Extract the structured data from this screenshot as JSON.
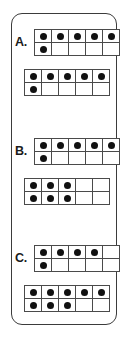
{
  "card": {
    "accent_color": "#3b3b3b",
    "dot_color": "#111111",
    "frame_line_color": "#4a4a4a",
    "background_color": "#ffffff"
  },
  "groups": [
    {
      "label": "A.",
      "frames": [
        {
          "name": "ten-frame-a-1",
          "top_row": [
            1,
            1,
            1,
            1,
            1
          ],
          "bottom_row": [
            1,
            0,
            0,
            0,
            0
          ],
          "count": 6
        },
        {
          "name": "ten-frame-a-2",
          "top_row": [
            1,
            1,
            1,
            1,
            1
          ],
          "bottom_row": [
            1,
            0,
            0,
            0,
            0
          ],
          "count": 6
        }
      ]
    },
    {
      "label": "B.",
      "frames": [
        {
          "name": "ten-frame-b-1",
          "top_row": [
            1,
            1,
            1,
            1,
            1
          ],
          "bottom_row": [
            1,
            0,
            0,
            0,
            0
          ],
          "count": 6
        },
        {
          "name": "ten-frame-b-2",
          "top_row": [
            1,
            1,
            1,
            0,
            0
          ],
          "bottom_row": [
            1,
            1,
            1,
            0,
            0
          ],
          "count": 6
        }
      ]
    },
    {
      "label": "C.",
      "frames": [
        {
          "name": "ten-frame-c-1",
          "top_row": [
            1,
            1,
            1,
            1,
            0
          ],
          "bottom_row": [
            1,
            0,
            0,
            0,
            0
          ],
          "count": 5
        },
        {
          "name": "ten-frame-c-2",
          "top_row": [
            1,
            1,
            1,
            1,
            1
          ],
          "bottom_row": [
            1,
            1,
            1,
            0,
            0
          ],
          "count": 8
        }
      ]
    }
  ],
  "layout": {
    "group_tops": [
      15,
      124,
      231
    ],
    "frame_offsets": [
      0,
      40
    ]
  }
}
